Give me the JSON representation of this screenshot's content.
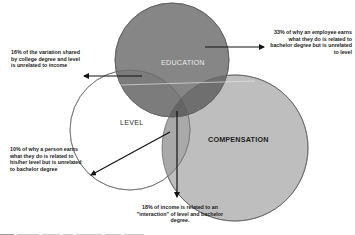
{
  "diagram": {
    "type": "venn",
    "circles": [
      {
        "id": "education",
        "label": "EDUCATION",
        "fill": "#868686",
        "label_color": "#e6e6e6"
      },
      {
        "id": "level",
        "label": "LEVEL",
        "fill": "#ffffff",
        "label_color": "#333333"
      },
      {
        "id": "compensation",
        "label": "COMPENSATION",
        "fill": "#bebebe",
        "label_color": "#222222"
      }
    ],
    "annotations": {
      "shared_degree_level": "16% of the variation shared by college degree and level is unrelated to income",
      "education_only": "33% of why an employee earns what they do is related to bachelor degree but is unrelated to level",
      "level_only": "10% of why a person earns what they do is related to his/her level but is unrelated to bachelor degree",
      "interaction": "18% of income is related to an \"interaction\" of level and bachelor degree."
    },
    "annotation_lines": {
      "shared_degree_level": [
        "16% of the variation shared",
        "by college degree and level",
        "is unrelated to income"
      ],
      "education_only": [
        "33% of why an employee earns",
        "what they do is related to",
        "bachelor degree but is unrelated",
        "to level"
      ],
      "level_only": [
        "10% of why a person earns",
        "what they do is related to",
        "his/her level but is unrelated",
        "to bachelor degree"
      ],
      "interaction": [
        "18% of income is related to an",
        "\"interaction\" of level and bachelor",
        "degree."
      ]
    },
    "percentages": {
      "shared_degree_level_unrelated_to_income": "16%",
      "education_only": "33%",
      "level_only": "10%",
      "interaction": "18%"
    },
    "colors": {
      "arrow": "#111111",
      "outline": "#555555",
      "background": "#ffffff"
    }
  }
}
